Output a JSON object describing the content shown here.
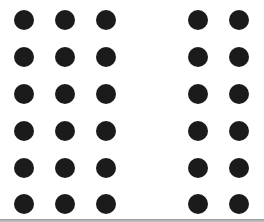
{
  "figure": {
    "dot_color": "#1b1b1b",
    "background": "#ffffff",
    "left_group": {
      "columns": 3,
      "rows": 6,
      "col_x": [
        24,
        65,
        106
      ]
    },
    "right_group": {
      "columns": 2,
      "rows": 6,
      "col_x": [
        198,
        239
      ]
    },
    "row_y": [
      20,
      57,
      94,
      131,
      168,
      204
    ],
    "dot_radius": 10,
    "total_dots": 30
  }
}
